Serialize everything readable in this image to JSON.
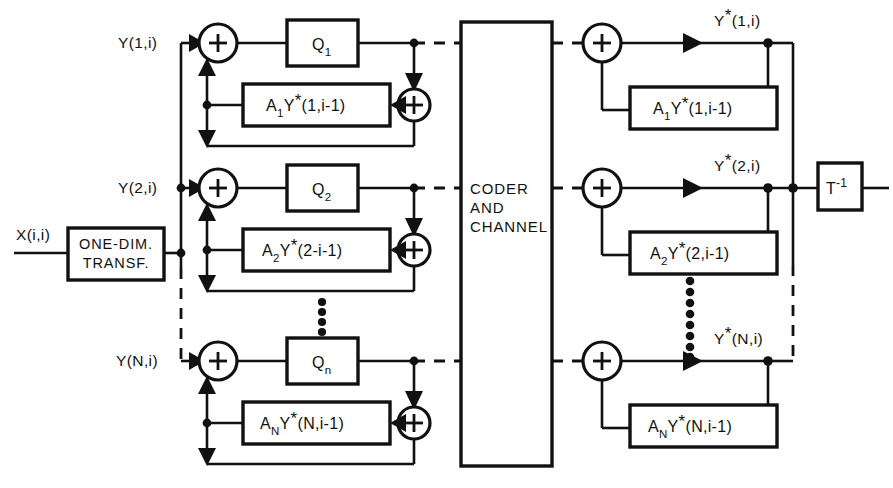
{
  "diagram": {
    "input": {
      "label": "X(i,i)"
    },
    "transform_block": {
      "line1": "ONE-DIM.",
      "line2": "TRANSF."
    },
    "channel_block": {
      "line1": "CODER",
      "line2": "AND",
      "line3": "CHANNEL"
    },
    "inverse_block": {
      "base": "T",
      "exponent": "-1"
    },
    "rows": [
      {
        "index": 1,
        "input_label_base": "Y",
        "input_label": "Y(1,i)",
        "quantizer_base": "Q",
        "quantizer_sub": "1",
        "predictor_a": "A",
        "predictor_a_sub": "1",
        "predictor_y": "Y",
        "predictor_args": "(1,i-1)",
        "output_base": "Y",
        "output_args": "(1,i)",
        "output_label": "Y*(1,i)",
        "decoder_a": "A",
        "decoder_a_sub": "1",
        "decoder_y": "Y",
        "decoder_args": "(1,i-1)"
      },
      {
        "index": 2,
        "input_label_base": "Y",
        "input_label": "Y(2,i)",
        "quantizer_base": "Q",
        "quantizer_sub": "2",
        "predictor_a": "A",
        "predictor_a_sub": "2",
        "predictor_y": "Y",
        "predictor_args": "(2-i-1)",
        "output_base": "Y",
        "output_args": "(2,i)",
        "output_label": "Y*(2,i)",
        "decoder_a": "A",
        "decoder_a_sub": "2",
        "decoder_y": "Y",
        "decoder_args": "(2,i-1)"
      },
      {
        "index": 3,
        "input_label_base": "Y",
        "input_label": "Y(N,i)",
        "quantizer_base": "Q",
        "quantizer_sub": "n",
        "predictor_a": "A",
        "predictor_a_sub": "N",
        "predictor_y": "Y",
        "predictor_args": "(N,i-1)",
        "output_base": "Y",
        "output_args": "(N,i)",
        "output_label": "Y*(N,i)",
        "decoder_a": "A",
        "decoder_a_sub": "N",
        "decoder_y": "Y",
        "decoder_args": "(N,i-1)"
      }
    ],
    "adder_symbol": "+",
    "star_symbol": "*",
    "colors": {
      "ink": "#111111",
      "paper": "#ffffff"
    }
  }
}
